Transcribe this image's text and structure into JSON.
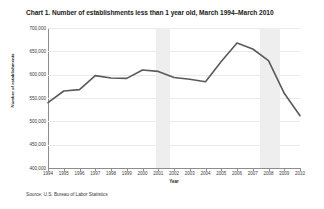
{
  "chart_title": "Chart 1. Number of establishments less than 1 year old, March 1994–March 2010",
  "source_note": "Source: U.S. Bureau of Labor Statistics",
  "axes": {
    "y_title": "Number of establishments",
    "x_title": "Year"
  },
  "chart_data": {
    "type": "line",
    "title": "Chart 1. Number of establishments less than 1 year old, March 1994–March 2010",
    "xlabel": "Year",
    "ylabel": "Number of establishments",
    "categories": [
      1994,
      1995,
      1996,
      1997,
      1998,
      1999,
      2000,
      2001,
      2002,
      2003,
      2004,
      2005,
      2006,
      2007,
      2008,
      2009,
      2010
    ],
    "values": [
      540000,
      565000,
      568000,
      598000,
      593000,
      592000,
      610000,
      607000,
      594000,
      590000,
      585000,
      628000,
      668000,
      655000,
      630000,
      560000,
      512000
    ],
    "xtick_labels": [
      "1994",
      "1995",
      "1996",
      "1997",
      "1998",
      "1999",
      "2000",
      "2001",
      "2002",
      "2003",
      "2004",
      "2005",
      "2006",
      "2007",
      "2008",
      "2009",
      "2010"
    ],
    "ytick_labels": [
      "700,000",
      "650,000",
      "600,000",
      "550,000",
      "500,000",
      "450,000",
      "400,000"
    ],
    "ytick_values": [
      700000,
      650000,
      600000,
      550000,
      500000,
      450000,
      400000
    ],
    "ylim": [
      400000,
      700000
    ],
    "xlim": [
      1994,
      2010
    ],
    "grid": true,
    "legend": "none",
    "line_color": "#5a5a5a",
    "grid_color": "#e9e9ea",
    "shaded_regions": [
      {
        "label": "recession",
        "start": 2000.85,
        "end": 2001.75
      },
      {
        "label": "recession",
        "start": 2007.45,
        "end": 2008.7
      }
    ]
  }
}
